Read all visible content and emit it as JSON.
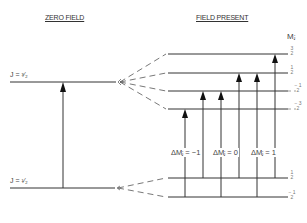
{
  "headers": {
    "zero_field": "ZERO FIELD",
    "field_present": "FIELD PRESENT",
    "mj_axis": "Mⱼ"
  },
  "zero_field_levels": [
    {
      "label": "J = ³⁄₂",
      "y": 82
    },
    {
      "label": "J = ¹⁄₂",
      "y": 188
    }
  ],
  "field_levels": {
    "upper": [
      {
        "mj": "3/2",
        "y": 54
      },
      {
        "mj": "1/2",
        "y": 73
      },
      {
        "mj": "-1/2",
        "y": 91
      },
      {
        "mj": "-3/2",
        "y": 109
      }
    ],
    "lower": [
      {
        "mj": "1/2",
        "y": 178
      },
      {
        "mj": "-1/2",
        "y": 197
      }
    ]
  },
  "mj_labels": {
    "u1": "3\n2",
    "u2": "1\n2",
    "u3": "− 1\n2",
    "u4": "− 3\n2",
    "l1": "1\n2",
    "l2": "− 1\n2"
  },
  "selection_rules": {
    "minus": "ΔMⱼ = −1",
    "zero": "ΔMⱼ = 0",
    "plus": "ΔMⱼ = 1"
  },
  "transitions": [
    {
      "x": 185,
      "from": -0.5,
      "to": -1.5
    },
    {
      "x": 203,
      "from": 0.5,
      "to": -0.5
    },
    {
      "x": 221,
      "from": -0.5,
      "to": -0.5
    },
    {
      "x": 239,
      "from": 0.5,
      "to": 0.5
    },
    {
      "x": 257,
      "from": -0.5,
      "to": 0.5
    },
    {
      "x": 275,
      "from": 0.5,
      "to": 1.5
    }
  ],
  "colors": {
    "line": "#333333",
    "dash": "#555555"
  }
}
